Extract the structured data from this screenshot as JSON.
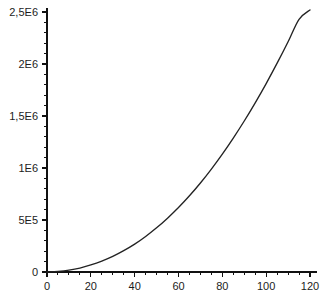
{
  "chart_data": {
    "type": "line",
    "title": "",
    "subtitle": "",
    "xlabel": "",
    "ylabel": "",
    "xlim": [
      0,
      122
    ],
    "ylim": [
      0,
      2550000
    ],
    "grid": false,
    "legend": false,
    "legend_position": "none",
    "x_tick_labels": [
      "0",
      "20",
      "40",
      "60",
      "80",
      "100",
      "120"
    ],
    "x_tick_values": [
      0,
      20,
      40,
      60,
      80,
      100,
      120
    ],
    "x_minor_tick_step": 5,
    "y_tick_labels": [
      "0",
      "5E5",
      "1E6",
      "1,5E6",
      "2E6",
      "2,5E6"
    ],
    "y_tick_values": [
      0,
      500000,
      1000000,
      1500000,
      2000000,
      2500000
    ],
    "y_minor_tick_step": 100000,
    "decimal_separator": "comma",
    "series": [
      {
        "name": "curve",
        "color": "#232323",
        "x": [
          0,
          5,
          10,
          15,
          20,
          25,
          30,
          35,
          40,
          45,
          50,
          55,
          60,
          65,
          70,
          75,
          80,
          85,
          90,
          95,
          100,
          105,
          110,
          115,
          120
        ],
        "values": [
          0,
          6000,
          18000,
          38000,
          68000,
          105000,
          150000,
          205000,
          268000,
          342000,
          425000,
          518000,
          620000,
          733000,
          856000,
          990000,
          1134000,
          1288000,
          1452000,
          1627000,
          1812000,
          2008000,
          2214000,
          2430000,
          2520000
        ]
      }
    ]
  },
  "axes": {
    "y_axis_name": "y-axis",
    "x_axis_name": "x-axis"
  }
}
